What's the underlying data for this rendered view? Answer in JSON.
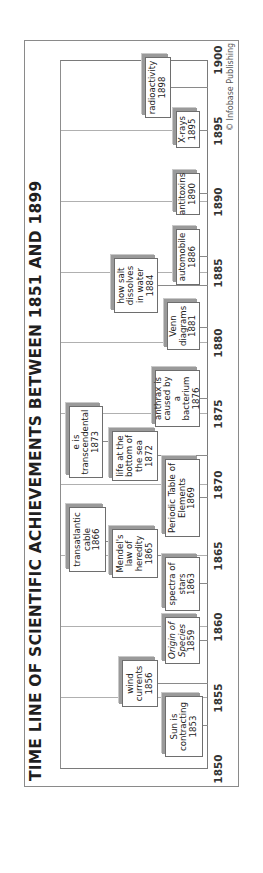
{
  "title": "TIME LINE OF SCIENTIFIC ACHIEVEMENTS BETWEEN 1851 AND 1899",
  "credit": "© Infobase Publishing",
  "axis": {
    "ticks": [
      "1850",
      "1855",
      "1860",
      "1865",
      "1870",
      "1875",
      "1880",
      "1885",
      "1890",
      "1895",
      "1900"
    ]
  },
  "events": [
    {
      "label": "Sun is contracting",
      "year": "1853"
    },
    {
      "label": "wind currents",
      "year": "1856"
    },
    {
      "label": "Origin of Species",
      "year": "1859"
    },
    {
      "label": "spectra of stars",
      "year": "1863"
    },
    {
      "label": "Mendel's law of heredity",
      "year": "1865"
    },
    {
      "label": "transatlantic cable",
      "year": "1866"
    },
    {
      "label": "Periodic Table of Elements",
      "year": "1869"
    },
    {
      "label": "life at the bottom of the sea",
      "year": "1872"
    },
    {
      "label": "e is transcendental",
      "year": "1873"
    },
    {
      "label": "anthrax is caused by a bacterium",
      "year": "1876"
    },
    {
      "label": "Venn diagrams",
      "year": "1881"
    },
    {
      "label": "how salt dissolves in water",
      "year": "1884"
    },
    {
      "label": "automobile",
      "year": "1886"
    },
    {
      "label": "antitoxins",
      "year": "1890"
    },
    {
      "label": "X-rays",
      "year": "1895"
    },
    {
      "label": "radioactivity",
      "year": "1898"
    }
  ],
  "colors": {
    "frame": "#8a8a8a",
    "text": "#222222",
    "shadow": "#9a9a9a"
  }
}
